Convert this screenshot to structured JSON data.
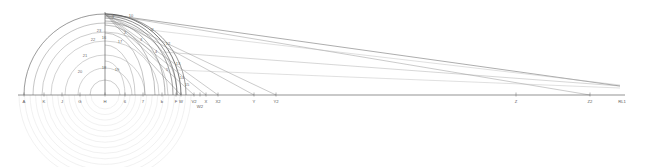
{
  "figure": {
    "type": "technical-construction-drawing",
    "title": "",
    "background_color": "#ffffff",
    "line_color_primary": "#3a3a3a",
    "line_color_secondary": "#7a7a7a",
    "line_color_faint": "#c8c8c8",
    "line_color_ghost": "#dcdcdc",
    "label_color": "#5a5a5a"
  },
  "baseline": {
    "name": "horizontal-ground-line",
    "y": 95,
    "x_start": 18,
    "x_end": 625
  },
  "center": {
    "x": 105,
    "y": 95,
    "label": "H"
  },
  "apex": {
    "x": 105,
    "y": 14
  },
  "vanishing_point": {
    "x": 620,
    "y": 86,
    "label": "RL1"
  },
  "baseline_points": [
    {
      "label": "A",
      "x": 24,
      "tick": true
    },
    {
      "label": "K",
      "x": 44,
      "tick": true
    },
    {
      "label": "J",
      "x": 62,
      "tick": true
    },
    {
      "label": "G",
      "x": 80,
      "tick": true
    },
    {
      "label": "H",
      "x": 105,
      "tick": true
    },
    {
      "label": "6",
      "x": 125,
      "tick": true
    },
    {
      "label": "7",
      "x": 143,
      "tick": true
    },
    {
      "label": "b",
      "x": 162,
      "tick": true
    },
    {
      "label": "F",
      "x": 176,
      "tick": true
    },
    {
      "label": "W",
      "x": 181,
      "tick": true
    },
    {
      "label": "V2",
      "x": 194,
      "tick": true
    },
    {
      "label": "X",
      "x": 206,
      "tick": true
    },
    {
      "label": "W2",
      "x": 200,
      "tick": true
    },
    {
      "label": "X2",
      "x": 218,
      "tick": true
    },
    {
      "label": "Y",
      "x": 254,
      "tick": true
    },
    {
      "label": "Y2",
      "x": 276,
      "tick": true
    },
    {
      "label": "Z",
      "x": 516,
      "tick": true
    },
    {
      "label": "Z2",
      "x": 590,
      "tick": true
    },
    {
      "label": "RL1",
      "x": 622,
      "tick": false
    }
  ],
  "arc_labels": [
    {
      "text": "1",
      "x": 113,
      "y": 17
    },
    {
      "text": "10",
      "x": 131,
      "y": 16
    },
    {
      "text": "11",
      "x": 152,
      "y": 30
    },
    {
      "text": "2",
      "x": 125,
      "y": 33
    },
    {
      "text": "3",
      "x": 141,
      "y": 40
    },
    {
      "text": "12",
      "x": 168,
      "y": 44
    },
    {
      "text": "4",
      "x": 156,
      "y": 52
    },
    {
      "text": "13",
      "x": 178,
      "y": 64
    },
    {
      "text": "5",
      "x": 167,
      "y": 70
    },
    {
      "text": "14",
      "x": 182,
      "y": 78
    },
    {
      "text": "15",
      "x": 187,
      "y": 85
    },
    {
      "text": "16",
      "x": 104,
      "y": 38
    },
    {
      "text": "17",
      "x": 120,
      "y": 42
    },
    {
      "text": "18",
      "x": 104,
      "y": 68
    },
    {
      "text": "19",
      "x": 117,
      "y": 70
    },
    {
      "text": "20",
      "x": 80,
      "y": 72
    },
    {
      "text": "21",
      "x": 85,
      "y": 56
    },
    {
      "text": "22",
      "x": 93,
      "y": 40
    },
    {
      "text": "23",
      "x": 99,
      "y": 31
    }
  ],
  "arcs_upper": [
    {
      "name": "outer-semicircle",
      "r": 81,
      "stroke": "#585858",
      "width": 0.6
    },
    {
      "name": "arc-22",
      "r": 72,
      "stroke": "#8a8a8a",
      "width": 0.5
    },
    {
      "name": "arc-21",
      "r": 63,
      "stroke": "#9a9a9a",
      "width": 0.5
    },
    {
      "name": "arc-20",
      "r": 54,
      "stroke": "#a5a5a5",
      "width": 0.5
    },
    {
      "name": "arc-19",
      "r": 40,
      "stroke": "#a5a5a5",
      "width": 0.5
    },
    {
      "name": "arc-18",
      "r": 27,
      "stroke": "#a5a5a5",
      "width": 0.5
    },
    {
      "name": "arc-17",
      "r": 15,
      "stroke": "#9a9a9a",
      "width": 0.5
    }
  ],
  "arcs_right_bundle": [
    {
      "name": "bundle-arc-1",
      "rx": 76,
      "ry": 81,
      "stroke": "#3a3a3a",
      "width": 0.7
    },
    {
      "name": "bundle-arc-2",
      "rx": 72,
      "ry": 79,
      "stroke": "#4a4a4a",
      "width": 0.6
    },
    {
      "name": "bundle-arc-3",
      "rx": 68,
      "ry": 77,
      "stroke": "#5a5a5a",
      "width": 0.6
    },
    {
      "name": "bundle-arc-4",
      "rx": 60,
      "ry": 74,
      "stroke": "#6a6a6a",
      "width": 0.5
    },
    {
      "name": "bundle-arc-5",
      "rx": 50,
      "ry": 70,
      "stroke": "#7a7a7a",
      "width": 0.5
    },
    {
      "name": "bundle-arc-6",
      "rx": 40,
      "ry": 62,
      "stroke": "#8a8a8a",
      "width": 0.5
    },
    {
      "name": "bundle-arc-7",
      "rx": 30,
      "ry": 50,
      "stroke": "#9a9a9a",
      "width": 0.5
    },
    {
      "name": "bundle-arc-8",
      "rx": 20,
      "ry": 34,
      "stroke": "#a5a5a5",
      "width": 0.5
    }
  ],
  "arcs_lower_ghost": {
    "name": "lower-concentric-construction-arcs",
    "count": 14,
    "center_x": 105,
    "center_y": 95,
    "r_min": 14,
    "r_max": 86,
    "stroke": "#dcdcdc"
  },
  "radiating_lines": [
    {
      "name": "ray-to-RL1-upper",
      "x1": 105,
      "y1": 14,
      "x2": 620,
      "y2": 86,
      "stroke": "#5a5a5a",
      "width": 0.5
    },
    {
      "name": "ray-to-Z2",
      "x1": 105,
      "y1": 14,
      "x2": 590,
      "y2": 95,
      "stroke": "#8a8a8a",
      "width": 0.45
    },
    {
      "name": "ray-to-Y2",
      "x1": 105,
      "y1": 14,
      "x2": 276,
      "y2": 95,
      "stroke": "#8a8a8a",
      "width": 0.45
    },
    {
      "name": "ray-to-Y",
      "x1": 105,
      "y1": 14,
      "x2": 254,
      "y2": 95,
      "stroke": "#8a8a8a",
      "width": 0.45
    },
    {
      "name": "ray-to-X2",
      "x1": 105,
      "y1": 14,
      "x2": 218,
      "y2": 95,
      "stroke": "#8a8a8a",
      "width": 0.45
    },
    {
      "name": "ray-to-X",
      "x1": 105,
      "y1": 14,
      "x2": 206,
      "y2": 95,
      "stroke": "#8a8a8a",
      "width": 0.45
    },
    {
      "name": "ray-to-V2",
      "x1": 105,
      "y1": 14,
      "x2": 194,
      "y2": 95,
      "stroke": "#8a8a8a",
      "width": 0.45
    },
    {
      "name": "ray-to-W",
      "x1": 105,
      "y1": 14,
      "x2": 181,
      "y2": 95,
      "stroke": "#7a7a7a",
      "width": 0.45
    },
    {
      "name": "ray-horizon-1",
      "x1": 163,
      "y1": 52,
      "x2": 620,
      "y2": 86,
      "stroke": "#9a9a9a",
      "width": 0.4
    },
    {
      "name": "ray-horizon-2",
      "x1": 176,
      "y1": 70,
      "x2": 620,
      "y2": 88,
      "stroke": "#b0b0b0",
      "width": 0.4
    },
    {
      "name": "ray-horizon-3",
      "x1": 150,
      "y1": 30,
      "x2": 620,
      "y2": 85,
      "stroke": "#b0b0b0",
      "width": 0.4
    }
  ],
  "vertical_axis": {
    "name": "central-vertical-axis",
    "x": 105,
    "y_top": 12,
    "y_bottom": 95
  }
}
